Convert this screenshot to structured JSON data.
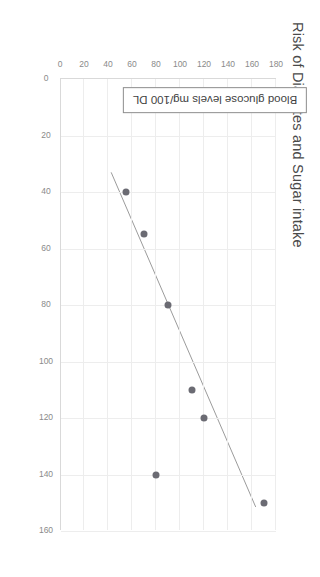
{
  "chart_data": {
    "type": "scatter",
    "title": "Risk of Diabetes and Sugar intake",
    "xlabel": "",
    "ylabel": "Blood glucose levels mg/100 DL",
    "xlim": [
      0,
      160
    ],
    "ylim": [
      0,
      180
    ],
    "xticks": [
      0,
      20,
      40,
      60,
      80,
      100,
      120,
      140,
      160
    ],
    "yticks": [
      0,
      20,
      40,
      60,
      80,
      100,
      120,
      140,
      160,
      180
    ],
    "grid": true,
    "legend": null,
    "orientation": "rotated-90-clockwise",
    "point_color": "#6b6b73",
    "trendline_color": "#9a9a9a",
    "grid_color": "#ededed",
    "axis_color": "#d9d9d9",
    "points": [
      {
        "x": 40,
        "y": 55
      },
      {
        "x": 55,
        "y": 70
      },
      {
        "x": 80,
        "y": 90
      },
      {
        "x": 110,
        "y": 110
      },
      {
        "x": 120,
        "y": 120
      },
      {
        "x": 140,
        "y": 80
      },
      {
        "x": 150,
        "y": 170
      }
    ],
    "trendline": {
      "x0": 33,
      "y0": 42,
      "x1": 152,
      "y1": 163
    }
  },
  "labels": {
    "title": "Risk of Diabetes and Sugar intake",
    "y_axis_title": "Blood glucose levels mg/100 DL",
    "xticks": [
      "0",
      "20",
      "40",
      "60",
      "80",
      "100",
      "120",
      "140",
      "160"
    ],
    "yticks": [
      "0",
      "20",
      "40",
      "60",
      "80",
      "100",
      "120",
      "140",
      "160",
      "180"
    ]
  }
}
